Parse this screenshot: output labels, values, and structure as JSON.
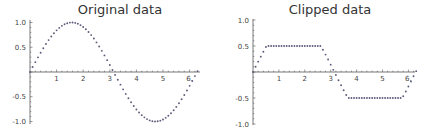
{
  "chart_data": [
    {
      "type": "scatter",
      "title": "Original data",
      "xlabel": "",
      "ylabel": "",
      "x_ticks": [
        "1",
        "2",
        "3",
        "4",
        "5",
        "6."
      ],
      "x_tick_values": [
        1,
        2,
        3,
        4,
        5,
        6
      ],
      "y_ticks": [
        "1.0",
        "0.5",
        "-0.5",
        "-1.0"
      ],
      "y_tick_values": [
        1.0,
        0.5,
        -0.5,
        -1.0
      ],
      "xlim": [
        0,
        6.3
      ],
      "ylim": [
        -1.0,
        1.0
      ],
      "grid": false,
      "legend": null,
      "function": "sin(x)",
      "x_start": 0,
      "x_step": 0.1,
      "n_points": 64,
      "clip": null,
      "color": "#5e5a7a"
    },
    {
      "type": "scatter",
      "title": "Clipped data",
      "xlabel": "",
      "ylabel": "",
      "x_ticks": [
        "1",
        "2",
        "3",
        "4",
        "5",
        "6."
      ],
      "x_tick_values": [
        1,
        2,
        3,
        4,
        5,
        6
      ],
      "y_ticks": [
        "1.0",
        "0.5",
        "-0.5",
        "-1.0"
      ],
      "y_tick_values": [
        1.0,
        0.5,
        -0.5,
        -1.0
      ],
      "xlim": [
        0,
        6.3
      ],
      "ylim": [
        -1.0,
        1.0
      ],
      "grid": false,
      "legend": null,
      "function": "clip(sin(x), -0.5, 0.5)",
      "x_start": 0,
      "x_step": 0.1,
      "n_points": 64,
      "clip": [
        -0.5,
        0.5
      ],
      "color": "#5e5a7a"
    }
  ]
}
